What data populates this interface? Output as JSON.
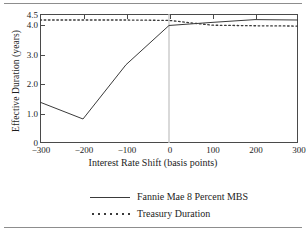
{
  "chart_data": {
    "type": "line",
    "title": "",
    "xlabel": "Interest Rate Shift (basis points)",
    "ylabel": "Effective Duration (years)",
    "xlim": [
      -300,
      300
    ],
    "ylim": [
      0,
      4.5
    ],
    "xticks": [
      "-300",
      "-200",
      "-100",
      "0",
      "100",
      "200",
      "300"
    ],
    "xtick_values": [
      -300,
      -200,
      -100,
      0,
      100,
      200,
      300
    ],
    "yticks": [
      "0",
      "1.0",
      "2.0",
      "3.0",
      "4.0",
      "4.5"
    ],
    "ytick_values": [
      0,
      1.0,
      2.0,
      3.0,
      4.0,
      4.5
    ],
    "grid": false,
    "legend_position": "below",
    "reference_line_x": 0,
    "series": [
      {
        "name": "Fannie Mae 8 Percent MBS",
        "style": "solid",
        "color": "#3a3a3a",
        "x": [
          -300,
          -200,
          -100,
          0,
          100,
          200,
          300
        ],
        "values": [
          1.35,
          0.78,
          2.62,
          3.95,
          4.08,
          4.22,
          4.2
        ]
      },
      {
        "name": "Treasury Duration",
        "style": "dotted",
        "color": "#3a3a3a",
        "x": [
          -300,
          -200,
          -100,
          0,
          100,
          200,
          300
        ],
        "values": [
          4.2,
          4.2,
          4.2,
          4.18,
          3.96,
          3.94,
          3.93
        ]
      }
    ]
  },
  "axes": {
    "y_title": "Effective Duration (years)",
    "x_title": "Interest Rate Shift (basis points)"
  },
  "legend": {
    "items": [
      {
        "label": "Fannie Mae 8 Percent MBS",
        "key": "solid-line-key"
      },
      {
        "label": "Treasury Duration",
        "key": "dotted-line-key"
      }
    ]
  },
  "colors": {
    "line": "#3a3a3a",
    "axis": "#4a4a4a",
    "reference": "#c9c9c9",
    "rule": "#8d8d8d"
  }
}
